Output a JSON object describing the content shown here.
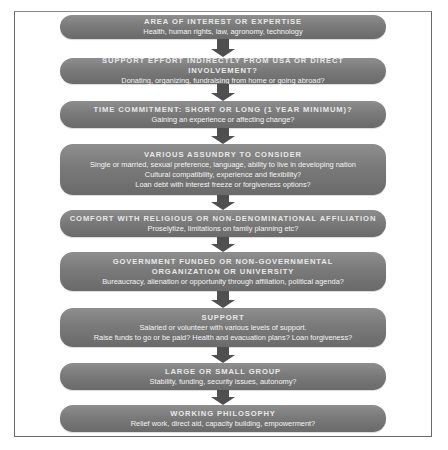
{
  "diagram": {
    "type": "vertical-flowchart",
    "colors": {
      "box": "#7a7a7a",
      "arrow": "#4f4f4f",
      "text": "#f2f2f2",
      "frame": "#6a6a6a"
    },
    "steps": [
      {
        "title": "Area of Interest or Expertise",
        "lines": [
          "Health, human rights, law, agronomy, technology"
        ]
      },
      {
        "title": "Support Effort Indirectly from USA or Direct Involvement?",
        "lines": [
          "Donating, organizing, fundraising from home or going abroad?"
        ]
      },
      {
        "title": "Time Commitment: Short or Long (1 Year Minimum)?",
        "lines": [
          "Gaining an experience or affecting change?"
        ]
      },
      {
        "title": "Various Assundry to Consider",
        "lines": [
          "Single or married, sexual preference, language, ability to live in developing nation",
          "Cultural compatibility, experience and flexibility?",
          "Loan debt with interest freeze or forgiveness options?"
        ]
      },
      {
        "title": "Comfort with Religious or Non-Denominational Affiliation",
        "lines": [
          "Proselytize, limitations on family planning etc?"
        ]
      },
      {
        "title": "Government Funded or Non-Governmental",
        "title2": "Organization or University",
        "lines": [
          "Bureaucracy, alienation or opportunity through affiliation, political agenda?"
        ]
      },
      {
        "title": "Support",
        "lines": [
          "Salaried or volunteer with various levels of support.",
          "Raise funds to go or be paid? Health and evacuation plans? Loan forgiveness?"
        ]
      },
      {
        "title": "Large or Small Group",
        "lines": [
          "Stability, funding, security issues, autonomy?"
        ]
      },
      {
        "title": "Working Philosophy",
        "lines": [
          "Relief work, direct aid, capacity building, empowerment?"
        ]
      }
    ]
  }
}
